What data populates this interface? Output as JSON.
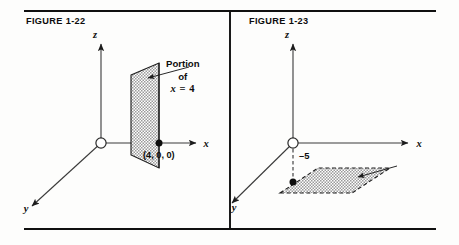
{
  "page": {
    "background": "#fdfdfc",
    "rule_color": "#101010"
  },
  "figures": [
    {
      "caption": "FIGURE 1-22",
      "axes": {
        "z": "z",
        "x": "x",
        "y": "y"
      },
      "point_label": "(4, 0, 0)",
      "callout": {
        "line1": "Portion",
        "line2": "of",
        "variable": "x",
        "operator": "=",
        "value": "4"
      },
      "plane": "vertical plane x = 4",
      "shade_color": "#b9b9b9",
      "stroke_color": "#1c1c1c"
    },
    {
      "caption": "FIGURE 1-23",
      "axes": {
        "z": "z",
        "x": "x",
        "y": "y"
      },
      "tick_label": "–5",
      "callout": {
        "line1": "Portion",
        "line2": "of",
        "variable": "z",
        "operator": "=",
        "value": "–5"
      },
      "plane": "horizontal plane z = -5",
      "shade_color": "#b9b9b9",
      "stroke_color": "#1c1c1c"
    }
  ]
}
